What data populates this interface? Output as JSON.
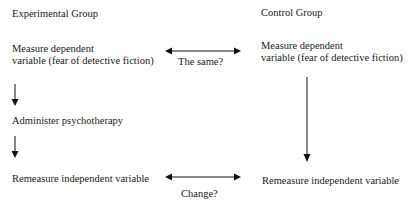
{
  "experimental": {
    "title": "Experimental Group",
    "step1_line1": "Measure dependent",
    "step1_line2": "variable (fear of detective fiction)",
    "step2": "Administer psychotherapy",
    "step3": "Remeasure independent variable"
  },
  "control": {
    "title": "Control Group",
    "step1_line1": "Measure dependent",
    "step1_line2": "variable (fear of detective fiction)",
    "step3": "Remeasure independent variable"
  },
  "comparisons": {
    "pre": "The same?",
    "post": "Change?"
  },
  "colors": {
    "text": "#1a1a1a",
    "arrow": "#111111",
    "background": "#ffffff"
  }
}
